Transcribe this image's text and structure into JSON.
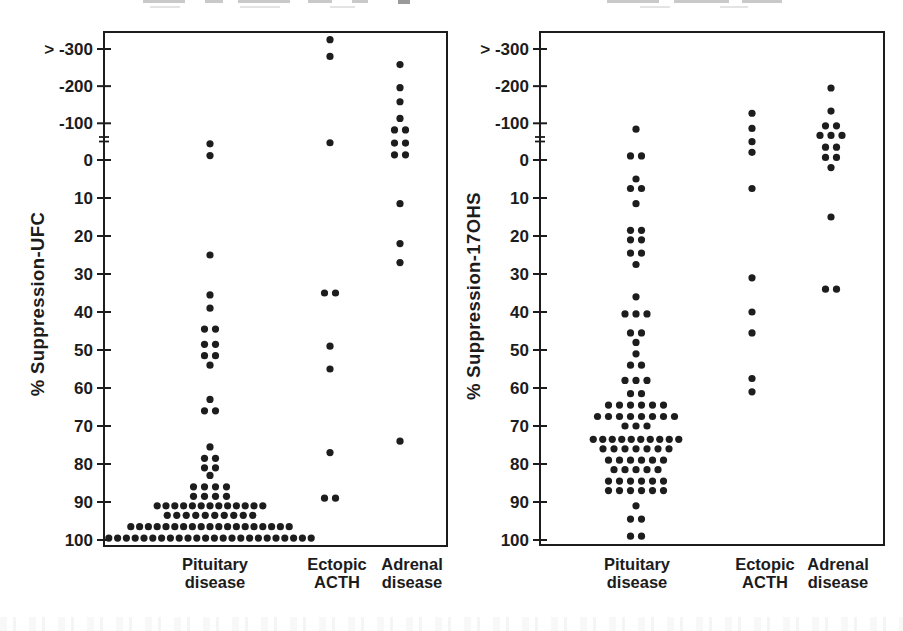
{
  "figure": {
    "background": "#ffffff",
    "ink": "#1c1c1c",
    "dot_color": "#1d1d1d",
    "note": "Scanned two-panel dot plot; titles above panels are cropped off at the top edge (illegible remnants visible)."
  },
  "artifacts": {
    "cropped_top_text_marks_left": [
      [
        143,
        42
      ],
      [
        205,
        18
      ],
      [
        238,
        52
      ],
      [
        308,
        24
      ],
      [
        352,
        16
      ],
      [
        398,
        12
      ]
    ],
    "cropped_top_text_marks_right": [
      [
        607,
        52
      ],
      [
        674,
        55
      ],
      [
        742,
        40
      ]
    ],
    "cropped_top_text_marks_faint": [
      [
        150,
        30
      ],
      [
        240,
        40
      ],
      [
        330,
        25
      ],
      [
        640,
        30
      ],
      [
        720,
        28
      ]
    ]
  },
  "chart_data": [
    {
      "type": "scatter",
      "variant": "stacked-dot-strip-plot",
      "title": "",
      "xlabel": "",
      "ylabel": "% Suppression-UFC",
      "y_axis": {
        "tick_values": [
          -300,
          -200,
          -100,
          0,
          10,
          20,
          30,
          40,
          50,
          60,
          70,
          80,
          90,
          100
        ],
        "tick_labels": [
          "> -300",
          "-200",
          "-100",
          "0",
          "10",
          "20",
          "30",
          "40",
          "50",
          "60",
          "70",
          "80",
          "90",
          "100"
        ],
        "top_overflow_label": "> -300",
        "axis_break_between": [
          -100,
          0
        ],
        "direction": "values increase downward",
        "grid": "off",
        "legend": "none"
      },
      "categories": [
        {
          "label": "Pituitary disease",
          "label_lines": [
            "Pituitary",
            "disease"
          ],
          "n_points": 95,
          "rows": [
            {
              "v": -44,
              "n": 1
            },
            {
              "v": -12,
              "n": 1
            },
            {
              "v": 25,
              "n": 1
            },
            {
              "v": 35.5,
              "n": 1
            },
            {
              "v": 39,
              "n": 1
            },
            {
              "v": 44.5,
              "n": 2
            },
            {
              "v": 48.5,
              "n": 2
            },
            {
              "v": 51.5,
              "n": 2
            },
            {
              "v": 54,
              "n": 1
            },
            {
              "v": 63,
              "n": 1
            },
            {
              "v": 66,
              "n": 2
            },
            {
              "v": 75.5,
              "n": 1
            },
            {
              "v": 78.5,
              "n": 2
            },
            {
              "v": 81,
              "n": 2
            },
            {
              "v": 83,
              "n": 1
            },
            {
              "v": 86,
              "n": 4
            },
            {
              "v": 88.5,
              "n": 4
            },
            {
              "v": 91,
              "n": 13
            },
            {
              "v": 93.5,
              "n": 10
            },
            {
              "v": 96.5,
              "n": 19
            },
            {
              "v": 99.5,
              "n": 24
            }
          ]
        },
        {
          "label": "Ectopic ACTH",
          "label_lines": [
            "Ectopic",
            "ACTH"
          ],
          "n_points": 10,
          "rows": [
            {
              "v": -325,
              "n": 1
            },
            {
              "v": -280,
              "n": 1
            },
            {
              "v": -47,
              "n": 1
            },
            {
              "v": 35,
              "n": 2
            },
            {
              "v": 49,
              "n": 1
            },
            {
              "v": 55,
              "n": 1
            },
            {
              "v": 77,
              "n": 1
            },
            {
              "v": 89,
              "n": 2
            }
          ]
        },
        {
          "label": "Adrenal disease",
          "label_lines": [
            "Adrenal",
            "disease"
          ],
          "n_points": 14,
          "rows": [
            {
              "v": -258,
              "n": 1
            },
            {
              "v": -196,
              "n": 1
            },
            {
              "v": -158,
              "n": 1
            },
            {
              "v": -113,
              "n": 1
            },
            {
              "v": -82,
              "n": 2
            },
            {
              "v": -46,
              "n": 2
            },
            {
              "v": -14,
              "n": 2
            },
            {
              "v": 11.5,
              "n": 1
            },
            {
              "v": 22,
              "n": 1
            },
            {
              "v": 27,
              "n": 1
            },
            {
              "v": 74,
              "n": 1
            }
          ]
        }
      ]
    },
    {
      "type": "scatter",
      "variant": "stacked-dot-strip-plot",
      "title": "",
      "xlabel": "",
      "ylabel": "% Suppression-17OHS",
      "y_axis": {
        "tick_values": [
          -300,
          -200,
          -100,
          0,
          10,
          20,
          30,
          40,
          50,
          60,
          70,
          80,
          90,
          100
        ],
        "tick_labels": [
          "> -300",
          "-200",
          "-100",
          "0",
          "10",
          "20",
          "30",
          "40",
          "50",
          "60",
          "70",
          "80",
          "90",
          "100"
        ],
        "top_overflow_label": "> -300",
        "axis_break_between": [
          -100,
          0
        ],
        "direction": "values increase downward",
        "grid": "off",
        "legend": "none"
      },
      "categories": [
        {
          "label": "Pituitary disease",
          "label_lines": [
            "Pituitary",
            "disease"
          ],
          "n_points": 91,
          "rows": [
            {
              "v": -84,
              "n": 1
            },
            {
              "v": -11,
              "n": 2
            },
            {
              "v": 5,
              "n": 1
            },
            {
              "v": 7.5,
              "n": 2
            },
            {
              "v": 11.5,
              "n": 1
            },
            {
              "v": 18.5,
              "n": 2
            },
            {
              "v": 21,
              "n": 2
            },
            {
              "v": 24.5,
              "n": 2
            },
            {
              "v": 27.5,
              "n": 1
            },
            {
              "v": 36,
              "n": 1
            },
            {
              "v": 40.5,
              "n": 3
            },
            {
              "v": 45.5,
              "n": 2
            },
            {
              "v": 48,
              "n": 1
            },
            {
              "v": 51,
              "n": 1
            },
            {
              "v": 54,
              "n": 2
            },
            {
              "v": 58,
              "n": 3
            },
            {
              "v": 61.5,
              "n": 2
            },
            {
              "v": 64.5,
              "n": 6
            },
            {
              "v": 67.5,
              "n": 8
            },
            {
              "v": 70,
              "n": 3
            },
            {
              "v": 73.5,
              "n": 10
            },
            {
              "v": 76,
              "n": 7
            },
            {
              "v": 79,
              "n": 6
            },
            {
              "v": 81.5,
              "n": 5
            },
            {
              "v": 84.5,
              "n": 6
            },
            {
              "v": 87,
              "n": 6
            },
            {
              "v": 91,
              "n": 1
            },
            {
              "v": 94.5,
              "n": 2
            },
            {
              "v": 99,
              "n": 2
            }
          ]
        },
        {
          "label": "Ectopic ACTH",
          "label_lines": [
            "Ectopic",
            "ACTH"
          ],
          "n_points": 10,
          "rows": [
            {
              "v": -127,
              "n": 1
            },
            {
              "v": -86,
              "n": 1
            },
            {
              "v": -50,
              "n": 1
            },
            {
              "v": -21,
              "n": 1
            },
            {
              "v": 7.5,
              "n": 1
            },
            {
              "v": 31,
              "n": 1
            },
            {
              "v": 40,
              "n": 1
            },
            {
              "v": 45.5,
              "n": 1
            },
            {
              "v": 57.5,
              "n": 1
            },
            {
              "v": 61,
              "n": 1
            }
          ]
        },
        {
          "label": "Adrenal disease",
          "label_lines": [
            "Adrenal",
            "disease"
          ],
          "n_points": 15,
          "rows": [
            {
              "v": -195,
              "n": 1
            },
            {
              "v": -133,
              "n": 1
            },
            {
              "v": -93,
              "n": 2
            },
            {
              "v": -67,
              "n": 3
            },
            {
              "v": -35,
              "n": 2
            },
            {
              "v": -7,
              "n": 2
            },
            {
              "v": 2,
              "n": 1
            },
            {
              "v": 15,
              "n": 1
            },
            {
              "v": 34,
              "n": 2
            }
          ]
        }
      ]
    }
  ]
}
